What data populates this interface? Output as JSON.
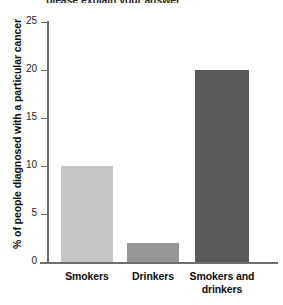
{
  "chart_data": {
    "type": "bar",
    "title": "",
    "title_clipped_fragment": "please explain your answer",
    "xlabel": "",
    "ylabel": "% of people diagnosed with a particular cancer",
    "categories": [
      "Smokers",
      "Drinkers",
      "Smokers and drinkers"
    ],
    "values": [
      10,
      2,
      20
    ],
    "ylim": [
      0,
      25
    ],
    "yticks": [
      0,
      5,
      10,
      15,
      20,
      25
    ],
    "ytick_labels": [
      "0",
      "5",
      "10",
      "15",
      "20",
      "25"
    ],
    "grid": false,
    "legend": false,
    "bar_colors": [
      "#c6c6c6",
      "#969696",
      "#5a5a5a"
    ],
    "axis_color": "#6e6e6e",
    "background": "#ffffff"
  },
  "axis": {
    "y_title": "% of people diagnosed with a particular cancer"
  },
  "x_labels": [
    {
      "line1": "Smokers",
      "line2": ""
    },
    {
      "line1": "Drinkers",
      "line2": ""
    },
    {
      "line1": "Smokers and",
      "line2": "drinkers"
    }
  ]
}
